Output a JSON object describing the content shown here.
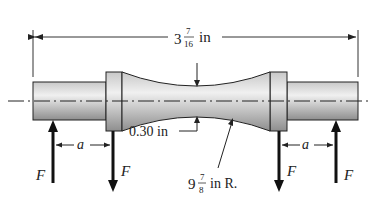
{
  "diagram": {
    "type": "mechanical-specimen",
    "overall_length": {
      "whole": "3",
      "num": "7",
      "den": "16",
      "unit": "in"
    },
    "neck_diameter": {
      "text": "0.30 in"
    },
    "radius": {
      "whole": "9",
      "num": "7",
      "den": "8",
      "unit": "in R."
    },
    "forces": [
      {
        "label": "F",
        "direction": "up",
        "position": "left-outer"
      },
      {
        "label": "F",
        "direction": "down",
        "position": "left-inner"
      },
      {
        "label": "F",
        "direction": "down",
        "position": "right-inner"
      },
      {
        "label": "F",
        "direction": "up",
        "position": "right-outer"
      }
    ],
    "spacing_labels": [
      "a",
      "a"
    ],
    "colors": {
      "body_light": "#e6e6e6",
      "body_dark": "#9a9a9a",
      "outline": "#222222"
    }
  }
}
